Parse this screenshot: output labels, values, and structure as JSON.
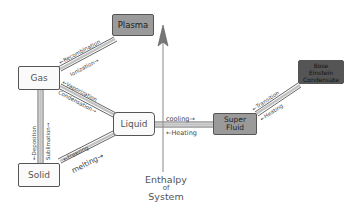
{
  "diagram": {
    "states": {
      "plasma": "Plasma",
      "gas": "Gas",
      "liquid": "Liquid",
      "solid": "Solid",
      "superfluid_l1": "Super",
      "superfluid_l2": "Fluid",
      "bec_l1": "Bose",
      "bec_l2": "Einstein",
      "bec_l3": "Condensate"
    },
    "transitions": {
      "recombination": "←Recombination",
      "ionization": "Ionization→",
      "vaporization": "←Vaporization",
      "condensation": "Condensation→",
      "deposition": "←Deposition",
      "sublimation": "Sublimation→",
      "freezing": "←Freezing",
      "melting": "melting→",
      "cooling": "cooling→",
      "heating_sf": "←Heating",
      "transition": "←Transition",
      "heating_bec": "←Heating"
    },
    "axis": {
      "line1": "Enthalpy",
      "line2": "of",
      "line3": "System"
    }
  }
}
